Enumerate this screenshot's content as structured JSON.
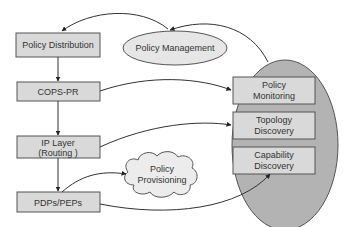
{
  "colors": {
    "box_fill": "#d9d9d9",
    "box_stroke": "#555555",
    "big_ellipse_fill": "#b3b3b3",
    "small_ellipse_fill": "#e6e6e6",
    "cloud_fill": "#ececec",
    "line": "#333333"
  },
  "left_stack": {
    "policy_distribution": "Policy Distribution",
    "cops_pr": "COPS-PR",
    "ip_layer_line1": "IP Layer",
    "ip_layer_line2": "(Routing )",
    "pdps_peps": "PDPs/PEPs"
  },
  "policy_management": "Policy Management",
  "policy_provisioning": {
    "line1": "Policy",
    "line2": "Provisioning"
  },
  "right_group": {
    "policy_monitoring": {
      "line1": "Policy",
      "line2": "Monitoring"
    },
    "topology_discovery": {
      "line1": "Topology",
      "line2": "Discovery"
    },
    "capability_discovery": {
      "line1": "Capability",
      "line2": "Discovery"
    }
  }
}
